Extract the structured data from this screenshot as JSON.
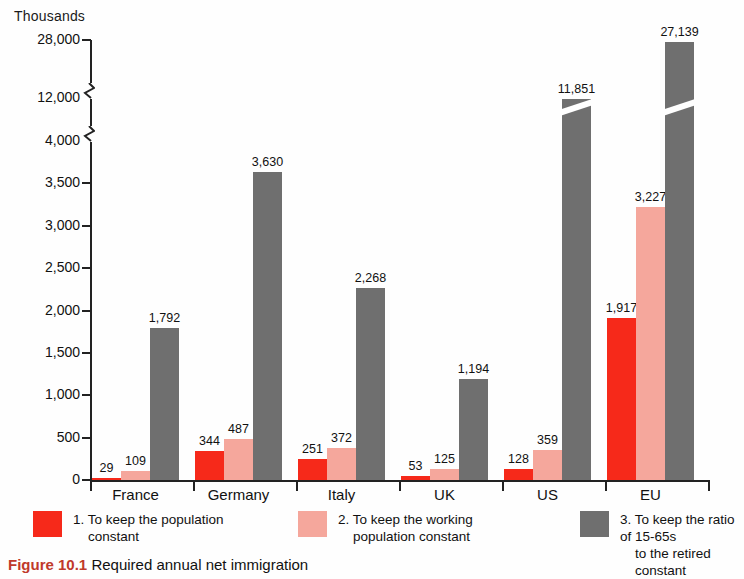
{
  "axis": {
    "unit_label": "Thousands",
    "tick_labels": [
      "0",
      "500",
      "1,000",
      "1,500",
      "2,000",
      "2,500",
      "3,000",
      "3,500",
      "4,000",
      "12,000",
      "28,000"
    ]
  },
  "legend": {
    "items": [
      {
        "number": "1.",
        "line1": "To keep the population",
        "line2": "constant",
        "color": "#f6291a",
        "swatch_name": "legend-swatch-population"
      },
      {
        "number": "2.",
        "line1": "To keep the working",
        "line2": "population constant",
        "color": "#f5a79c",
        "swatch_name": "legend-swatch-working-population"
      },
      {
        "number": "3.",
        "line1": "To keep the ratio of 15-65s",
        "line2": "to the retired constant",
        "color": "#6f6f6f",
        "swatch_name": "legend-swatch-ratio"
      }
    ]
  },
  "caption": {
    "figure_number": "Figure 10.1",
    "text": "Required annual net immigration"
  },
  "chart_data": {
    "type": "bar",
    "title": "",
    "subtitle": "",
    "xlabel": "",
    "ylabel": "Thousands",
    "categories": [
      "France",
      "Germany",
      "Italy",
      "UK",
      "US",
      "EU"
    ],
    "ylim": [
      0,
      28000
    ],
    "y_ticks": [
      0,
      500,
      1000,
      1500,
      2000,
      2500,
      3000,
      3500,
      4000,
      12000,
      28000
    ],
    "y_tick_labels": [
      "0",
      "500",
      "1,000",
      "1,500",
      "2,000",
      "2,500",
      "3,000",
      "3,500",
      "4,000",
      "12,000",
      "28,000"
    ],
    "axis_breaks": [
      [
        4000,
        12000
      ],
      [
        12000,
        28000
      ]
    ],
    "grid": false,
    "legend_position": "bottom",
    "series": [
      {
        "name": "1. To keep the population constant",
        "color": "#f6291a",
        "values": [
          29,
          344,
          251,
          53,
          128,
          1917
        ],
        "labels": [
          "29",
          "344",
          "251",
          "53",
          "128",
          "1,917"
        ]
      },
      {
        "name": "2. To keep the working population constant",
        "color": "#f5a79c",
        "values": [
          109,
          487,
          372,
          125,
          359,
          3227
        ],
        "labels": [
          "109",
          "487",
          "372",
          "125",
          "359",
          "3,227"
        ]
      },
      {
        "name": "3. To keep the ratio of 15-65s to the retired constant",
        "color": "#6f6f6f",
        "values": [
          1792,
          3630,
          2268,
          1194,
          11851,
          27139
        ],
        "labels": [
          "1,792",
          "3,630",
          "2,268",
          "1,194",
          "11,851",
          "27,139"
        ]
      }
    ]
  }
}
